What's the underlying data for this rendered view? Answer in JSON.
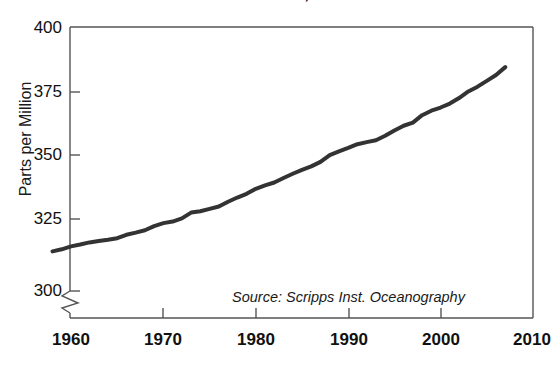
{
  "chart_data": {
    "type": "line",
    "title": "of Carbon Dioxide, 1958–2007",
    "xlabel": "",
    "ylabel": "Parts per Million",
    "xlim": [
      1958,
      2010
    ],
    "ylim": [
      292,
      400
    ],
    "xticks": [
      1960,
      1970,
      1980,
      1990,
      2000,
      2010
    ],
    "xtick_labels": [
      "1960",
      "1970",
      "1980",
      "1990",
      "2000",
      "2010"
    ],
    "yticks": [
      300,
      325,
      350,
      375,
      400
    ],
    "ytick_labels": [
      "300",
      "325",
      "350",
      "375",
      "400"
    ],
    "grid": false,
    "legend": "none",
    "axis_break": true,
    "axis_break_axis": "y",
    "annotations": [
      {
        "text": "Source: Scripps Inst. Oceanography",
        "x": 1988,
        "y": 298,
        "style": "italic"
      }
    ],
    "series": [
      {
        "name": "Atmospheric Carbon Dioxide",
        "color": "#333333",
        "line_width": 4,
        "x": [
          1958,
          1959,
          1960,
          1961,
          1962,
          1963,
          1964,
          1965,
          1966,
          1967,
          1968,
          1969,
          1970,
          1971,
          1972,
          1973,
          1974,
          1975,
          1976,
          1977,
          1978,
          1979,
          1980,
          1981,
          1982,
          1983,
          1984,
          1985,
          1986,
          1987,
          1988,
          1989,
          1990,
          1991,
          1992,
          1993,
          1994,
          1995,
          1996,
          1997,
          1998,
          1999,
          2000,
          2001,
          2002,
          2003,
          2004,
          2005,
          2006,
          2007
        ],
        "values": [
          315.0,
          315.8,
          316.9,
          317.6,
          318.4,
          318.9,
          319.4,
          320.0,
          321.3,
          322.1,
          323.0,
          324.6,
          325.7,
          326.3,
          327.5,
          329.7,
          330.2,
          331.1,
          332.0,
          333.8,
          335.4,
          336.8,
          338.7,
          340.0,
          341.1,
          342.8,
          344.4,
          345.9,
          347.2,
          348.9,
          351.5,
          352.9,
          354.2,
          355.6,
          356.4,
          357.1,
          358.8,
          360.8,
          362.6,
          363.8,
          366.6,
          368.3,
          369.5,
          371.0,
          373.1,
          375.6,
          377.4,
          379.6,
          381.8,
          384.8
        ]
      }
    ]
  },
  "axes": {
    "frame_color": "#555555",
    "tick_color": "#555555",
    "background": "#ffffff"
  }
}
